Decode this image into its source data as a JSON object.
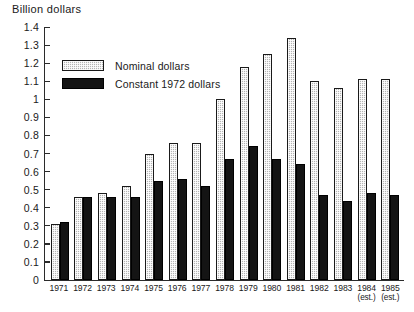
{
  "chart_data": {
    "type": "bar",
    "title": "Billion dollars",
    "xlabel": "",
    "ylabel": "Billion dollars",
    "ylim": [
      0,
      1.4
    ],
    "ytick_step": 0.1,
    "grid": false,
    "legend_position": "upper-left-inside",
    "categories": [
      "1971",
      "1972",
      "1973",
      "1974",
      "1975",
      "1976",
      "1977",
      "1978",
      "1979",
      "1980",
      "1981",
      "1982",
      "1983",
      "1984",
      "1985"
    ],
    "category_notes": [
      "",
      "",
      "",
      "",
      "",
      "",
      "",
      "",
      "",
      "",
      "",
      "",
      "",
      "(est.)",
      "(est.)"
    ],
    "yticks": [
      "1.4",
      "1.3",
      "1.2",
      "1.1",
      "1",
      "0.9",
      "0.8",
      "0.7",
      "0.6",
      "0.5",
      "0.4",
      "0.3",
      "0.2",
      "0.1",
      "0"
    ],
    "series": [
      {
        "name": "Nominal dollars",
        "color": "#b5b5b5",
        "values": [
          0.31,
          0.46,
          0.48,
          0.52,
          0.7,
          0.76,
          0.76,
          1.0,
          1.18,
          1.25,
          1.34,
          1.1,
          1.06,
          1.11,
          1.11
        ]
      },
      {
        "name": "Constant 1972 dollars",
        "color": "#141414",
        "values": [
          0.32,
          0.46,
          0.46,
          0.46,
          0.55,
          0.56,
          0.52,
          0.67,
          0.74,
          0.67,
          0.64,
          0.47,
          0.44,
          0.48,
          0.47
        ]
      }
    ]
  },
  "legend": {
    "items": [
      {
        "label": "Nominal dollars",
        "style": "nominal"
      },
      {
        "label": "Constant 1972 dollars",
        "style": "constant"
      }
    ]
  }
}
